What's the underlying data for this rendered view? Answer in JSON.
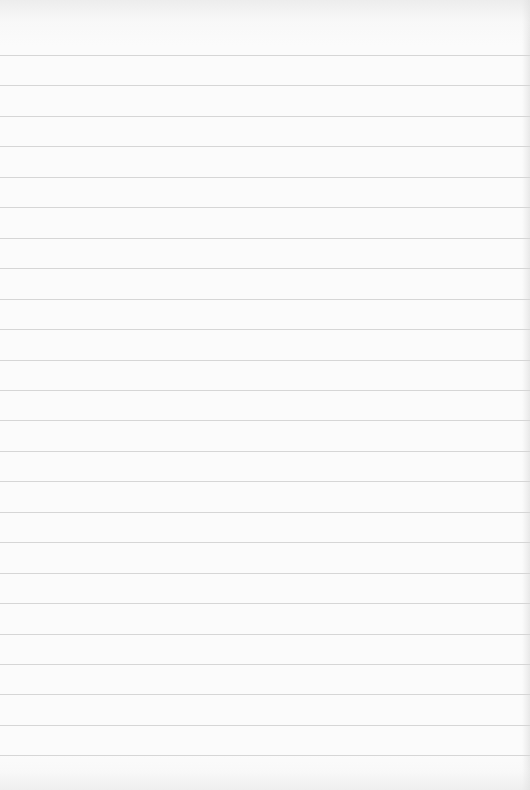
{
  "paper": {
    "background_color": "#fbfbfb",
    "rule_color": "#d6d6d6",
    "first_rule_y": 55,
    "rule_spacing": 30.45,
    "rule_count": 24
  }
}
